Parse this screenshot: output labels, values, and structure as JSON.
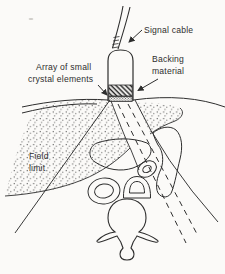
{
  "figure": {
    "type": "textbook-line-diagram",
    "colors": {
      "ink": "#2e2e2e",
      "paper": "#fbfaf8"
    },
    "labels": {
      "signal_cable": "Signal cable",
      "backing_line1": "Backing",
      "backing_line2": "material",
      "array_line1": "Array of small",
      "array_line2": "crystal elements",
      "field_line1": "Field",
      "field_line2": "limit"
    },
    "parts": [
      "signal-cable",
      "probe-body",
      "backing-material-hatch",
      "crystal-element-array-band",
      "skin-surface-lines",
      "stippled-tissue-mass",
      "curved-tissue-structure",
      "small-ring-structures",
      "vertebra-cross-section",
      "field-limit-lines",
      "beam-direction-dashed-lines"
    ]
  }
}
